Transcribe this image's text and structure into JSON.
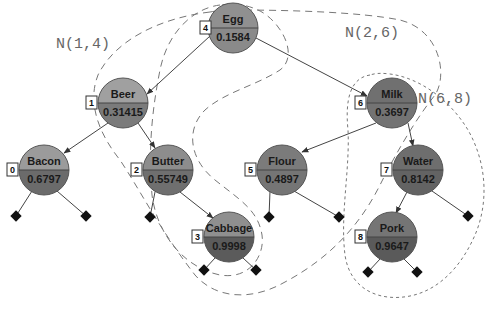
{
  "diagram": {
    "type": "treap",
    "region_labels": [
      {
        "id": "n14",
        "text": "N(1,4)",
        "x": 56,
        "y": 48
      },
      {
        "id": "n26",
        "text": "N(2,6)",
        "x": 345,
        "y": 37
      },
      {
        "id": "n68",
        "text": "N(6,8)",
        "x": 418,
        "y": 103
      }
    ],
    "nodes": [
      {
        "key": "4",
        "name": "Egg",
        "priority": "0.1584",
        "cx": 233,
        "cy": 28,
        "top": "#8f8f8f",
        "bottom": "#8a8a8a"
      },
      {
        "key": "1",
        "name": "Beer",
        "priority": "0.31415",
        "cx": 123,
        "cy": 103,
        "top": "#9e9e9e",
        "bottom": "#7a7a7a"
      },
      {
        "key": "6",
        "name": "Milk",
        "priority": "0.3697",
        "cx": 392,
        "cy": 103,
        "top": "#6f6f6f",
        "bottom": "#727272"
      },
      {
        "key": "0",
        "name": "Bacon",
        "priority": "0.6797",
        "cx": 44,
        "cy": 170,
        "top": "#9a9a9a",
        "bottom": "#6a6a6a"
      },
      {
        "key": "2",
        "name": "Butter",
        "priority": "0.55749",
        "cx": 168,
        "cy": 170,
        "top": "#8c8c8c",
        "bottom": "#6e6e6e"
      },
      {
        "key": "5",
        "name": "Flour",
        "priority": "0.4897",
        "cx": 282,
        "cy": 170,
        "top": "#7a7a7a",
        "bottom": "#747474"
      },
      {
        "key": "7",
        "name": "Water",
        "priority": "0.8142",
        "cx": 418,
        "cy": 170,
        "top": "#6d6d6d",
        "bottom": "#626262"
      },
      {
        "key": "3",
        "name": "Cabbage",
        "priority": "0.9998",
        "cx": 229,
        "cy": 237,
        "top": "#8e8e8e",
        "bottom": "#5a5a5a"
      },
      {
        "key": "8",
        "name": "Pork",
        "priority": "0.9647",
        "cx": 392,
        "cy": 237,
        "top": "#747474",
        "bottom": "#595959"
      }
    ],
    "edges": [
      {
        "from": "Egg",
        "to": "Beer"
      },
      {
        "from": "Egg",
        "to": "Milk"
      },
      {
        "from": "Beer",
        "to": "Bacon"
      },
      {
        "from": "Beer",
        "to": "Butter"
      },
      {
        "from": "Milk",
        "to": "Flour"
      },
      {
        "from": "Milk",
        "to": "Water"
      },
      {
        "from": "Butter",
        "to": "Cabbage"
      },
      {
        "from": "Water",
        "to": "Pork"
      }
    ],
    "leaves": [
      {
        "parent": "Bacon",
        "x": 16,
        "y": 216
      },
      {
        "parent": "Bacon",
        "x": 86,
        "y": 216
      },
      {
        "parent": "Butter",
        "x": 150,
        "y": 217
      },
      {
        "parent": "Cabbage",
        "x": 204,
        "y": 270
      },
      {
        "parent": "Cabbage",
        "x": 256,
        "y": 270
      },
      {
        "parent": "Flour",
        "x": 269,
        "y": 217
      },
      {
        "parent": "Flour",
        "x": 339,
        "y": 217
      },
      {
        "parent": "Water",
        "x": 468,
        "y": 216
      },
      {
        "parent": "Pork",
        "x": 368,
        "y": 272
      },
      {
        "parent": "Pork",
        "x": 417,
        "y": 272
      }
    ]
  }
}
